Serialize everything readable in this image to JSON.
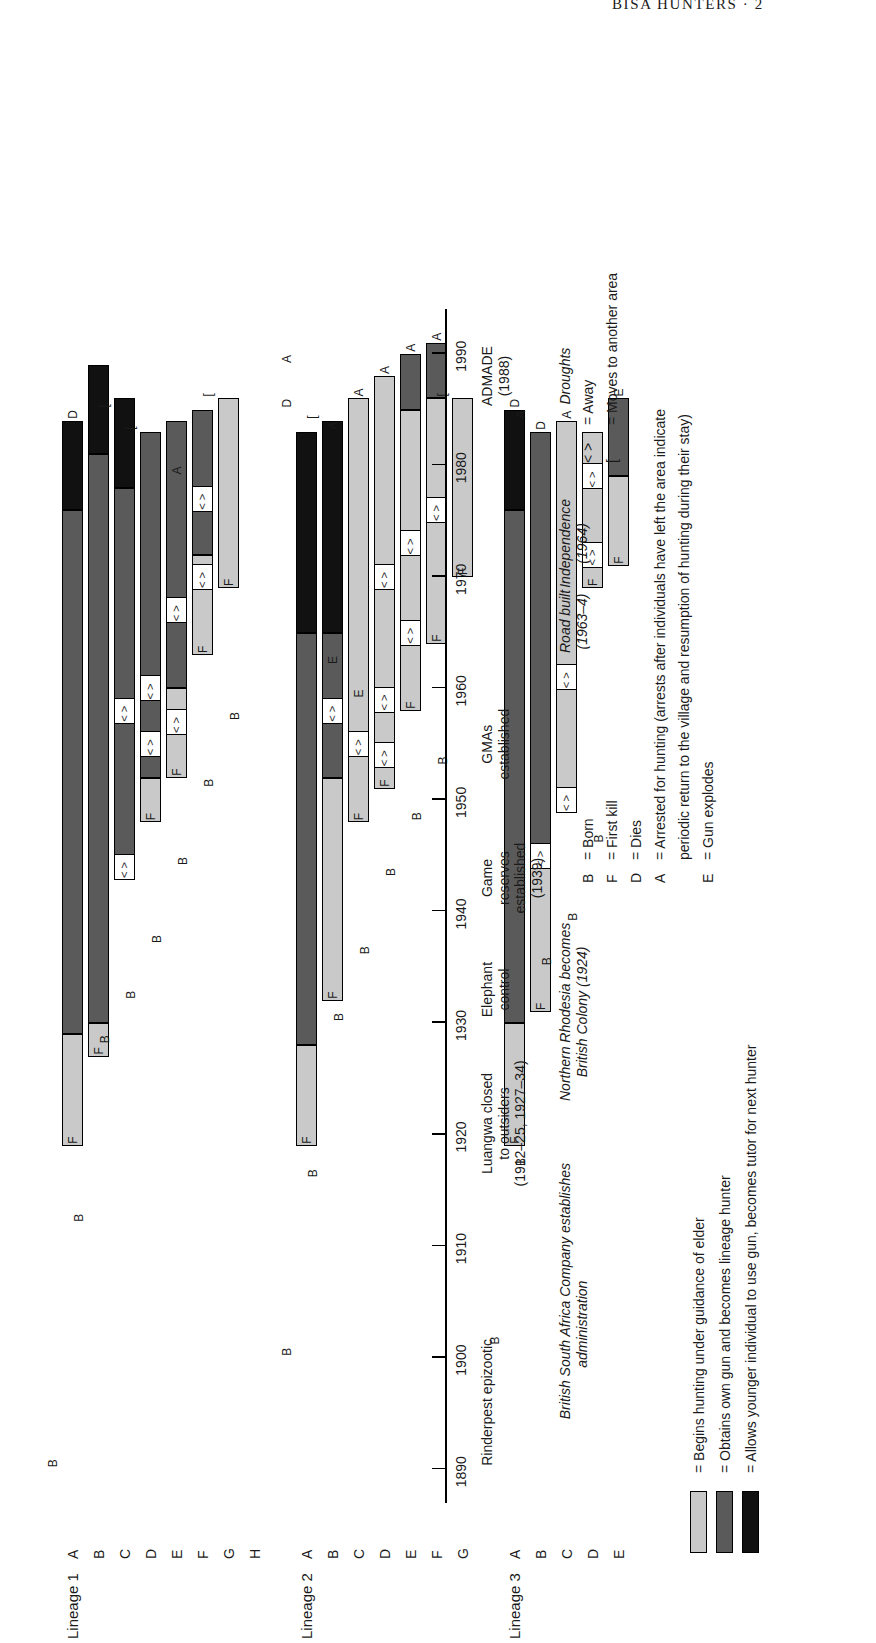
{
  "running_head": "BISA HUNTERS · 2",
  "figure": {
    "axis": {
      "ticks": [
        1890,
        1900,
        1910,
        1920,
        1930,
        1940,
        1950,
        1960,
        1970,
        1980,
        1990
      ],
      "min": 1885,
      "max": 1995
    },
    "events_upper": [
      {
        "lines": [
          "Rinderpest epizootic"
        ],
        "year": 1896,
        "italic": false
      },
      {
        "lines": [
          "Luangwa closed",
          "to outsiders",
          "(1912–25, 1927–34)"
        ],
        "year": 1921,
        "italic": false
      },
      {
        "lines": [
          "Elephant",
          "control"
        ],
        "year": 1933,
        "italic": false
      },
      {
        "lines": [
          "Game",
          "reserves",
          "established",
          "(1939)"
        ],
        "year": 1943,
        "italic": false
      },
      {
        "lines": [
          "GMAs",
          "established"
        ],
        "year": 1955,
        "italic": false
      },
      {
        "lines": [
          "ADMADE",
          "(1988)"
        ],
        "year": 1988,
        "italic": false
      }
    ],
    "events_lower": [
      {
        "lines": [
          "British South Africa Company establishes",
          "administration"
        ],
        "year": 1903,
        "italic": true
      },
      {
        "lines": [
          "Northern Rhodesia becomes",
          "British Colony (1924)"
        ],
        "year": 1931,
        "italic": true
      },
      {
        "lines": [
          "Road built",
          "(1963–4)"
        ],
        "year": 1966,
        "italic": true
      },
      {
        "lines": [
          "Independence",
          "(1964)"
        ],
        "year": 1973,
        "italic": true
      },
      {
        "lines": [
          "Droughts"
        ],
        "year": 1988,
        "italic": true
      }
    ],
    "lineages": [
      {
        "title": "Lineage 1",
        "hunters": [
          "A",
          "B",
          "C",
          "D",
          "E",
          "F",
          "G",
          "H"
        ]
      },
      {
        "title": "Lineage 2",
        "hunters": [
          "A",
          "B",
          "C",
          "D",
          "E",
          "F",
          "G"
        ]
      },
      {
        "title": "Lineage 3",
        "hunters": [
          "A",
          "B",
          "C",
          "D",
          "E"
        ]
      }
    ],
    "key_swatches": [
      {
        "fill": "#c9c9c9",
        "text": "= Begins hunting under guidance of elder"
      },
      {
        "fill": "#5a5a5a",
        "text": "= Obtains own gun and becomes lineage hunter"
      },
      {
        "fill": "#111111",
        "text": "= Allows younger individual to use gun, becomes tutor for next hunter"
      }
    ],
    "key_letters": [
      {
        "sym": "B",
        "text": "=  Born"
      },
      {
        "sym": "F",
        "text": "=  First kill"
      },
      {
        "sym": "D",
        "text": "=  Dies"
      },
      {
        "sym": "A",
        "text": "=  Arrested for hunting (arrests after individuals have left the area indicate"
      },
      {
        "sym": "",
        "text": "periodic return to the village and resumption of hunting during their stay)"
      },
      {
        "sym": "E",
        "text": "=  Gun explodes"
      }
    ],
    "key_symbols": [
      {
        "sym": "< >",
        "text": "=  Away"
      },
      {
        "sym": "[",
        "text": "=  Moves to another area"
      }
    ]
  },
  "chart_data": {
    "type": "bar",
    "xlabel": "Year",
    "ylabel": "",
    "xlim": [
      1885,
      1995
    ],
    "grid": false,
    "legend": "key at lower right",
    "phase_colors": {
      "apprentice": "#c9c9c9",
      "lineage_hunter": "#5a5a5a",
      "tutor": "#111111",
      "away": "#ffffff"
    },
    "series": [
      {
        "lineage": "Lineage 1",
        "hunters": [
          {
            "id": "A",
            "born": 1890,
            "first_kill": 1919,
            "segments": [
              {
                "phase": "apprentice",
                "start": 1919,
                "end": 1929
              },
              {
                "phase": "lineage_hunter",
                "start": 1929,
                "end": 1976
              },
              {
                "phase": "tutor",
                "start": 1976,
                "end": 1984
              }
            ],
            "events": [
              {
                "code": "B",
                "year": 1890
              },
              {
                "code": "F",
                "year": 1919
              },
              {
                "code": "D",
                "year": 1984
              }
            ]
          },
          {
            "id": "B",
            "born": 1912,
            "first_kill": 1927,
            "segments": [
              {
                "phase": "apprentice",
                "start": 1927,
                "end": 1930
              },
              {
                "phase": "lineage_hunter",
                "start": 1930,
                "end": 1981
              },
              {
                "phase": "tutor",
                "start": 1981,
                "end": 1989
              }
            ],
            "events": [
              {
                "code": "B",
                "year": 1912
              },
              {
                "code": "F",
                "year": 1927
              }
            ]
          },
          {
            "id": "C",
            "born": 1928,
            "first_kill": 1943,
            "segments": [
              {
                "phase": "lineage_hunter",
                "start": 1943,
                "end": 1978
              },
              {
                "phase": "tutor",
                "start": 1978,
                "end": 1986
              }
            ],
            "events": [
              {
                "code": "B",
                "year": 1928
              },
              {
                "code": "<>",
                "year": 1944
              },
              {
                "code": "<>",
                "year": 1958
              },
              {
                "code": "[",
                "year": 1985
              }
            ]
          },
          {
            "id": "D",
            "born": 1932,
            "first_kill": 1948,
            "segments": [
              {
                "phase": "apprentice",
                "start": 1948,
                "end": 1952
              },
              {
                "phase": "lineage_hunter",
                "start": 1952,
                "end": 1983
              }
            ],
            "events": [
              {
                "code": "B",
                "year": 1932
              },
              {
                "code": "F",
                "year": 1948
              },
              {
                "code": "<>",
                "year": 1955
              },
              {
                "code": "<>",
                "year": 1960
              },
              {
                "code": "[",
                "year": 1983
              }
            ]
          },
          {
            "id": "E",
            "born": 1937,
            "first_kill": 1952,
            "segments": [
              {
                "phase": "apprentice",
                "start": 1952,
                "end": 1960
              },
              {
                "phase": "lineage_hunter",
                "start": 1960,
                "end": 1984
              }
            ],
            "events": [
              {
                "code": "B",
                "year": 1937
              },
              {
                "code": "F",
                "year": 1952
              },
              {
                "code": "<>",
                "year": 1957
              },
              {
                "code": "<>",
                "year": 1967
              },
              {
                "code": "A",
                "year": 1979
              }
            ]
          },
          {
            "id": "F",
            "born": 1944,
            "first_kill": 1963,
            "segments": [
              {
                "phase": "apprentice",
                "start": 1963,
                "end": 1972
              },
              {
                "phase": "lineage_hunter",
                "start": 1972,
                "end": 1985
              }
            ],
            "events": [
              {
                "code": "B",
                "year": 1944
              },
              {
                "code": "F",
                "year": 1963
              },
              {
                "code": "<>",
                "year": 1970
              },
              {
                "code": "<>",
                "year": 1977
              }
            ]
          },
          {
            "id": "G",
            "born": 1951,
            "first_kill": 1969,
            "segments": [
              {
                "phase": "apprentice",
                "start": 1969,
                "end": 1986
              }
            ],
            "events": [
              {
                "code": "B",
                "year": 1951
              },
              {
                "code": "F",
                "year": 1969
              },
              {
                "code": "[",
                "year": 1986
              }
            ]
          },
          {
            "id": "H",
            "born": 1957,
            "first_kill": null,
            "segments": [],
            "events": [
              {
                "code": "B",
                "year": 1957
              }
            ]
          }
        ]
      },
      {
        "lineage": "Lineage 2",
        "hunters": [
          {
            "id": "A",
            "born": 1900,
            "first_kill": 1919,
            "segments": [
              {
                "phase": "apprentice",
                "start": 1919,
                "end": 1928
              },
              {
                "phase": "lineage_hunter",
                "start": 1928,
                "end": 1965
              },
              {
                "phase": "tutor",
                "start": 1965,
                "end": 1983
              }
            ],
            "events": [
              {
                "code": "B",
                "year": 1900
              },
              {
                "code": "F",
                "year": 1919
              },
              {
                "code": "D",
                "year": 1985
              },
              {
                "code": "A",
                "year": 1989
              }
            ]
          },
          {
            "id": "B",
            "born": 1916,
            "first_kill": 1932,
            "segments": [
              {
                "phase": "apprentice",
                "start": 1932,
                "end": 1952
              },
              {
                "phase": "lineage_hunter",
                "start": 1952,
                "end": 1965
              },
              {
                "phase": "tutor",
                "start": 1965,
                "end": 1984
              }
            ],
            "events": [
              {
                "code": "B",
                "year": 1916
              },
              {
                "code": "F",
                "year": 1932
              },
              {
                "code": "<>",
                "year": 1958
              },
              {
                "code": "E",
                "year": 1962
              },
              {
                "code": "A",
                "year": 1983
              },
              {
                "code": "[",
                "year": 1984
              }
            ]
          },
          {
            "id": "C",
            "born": 1930,
            "first_kill": 1948,
            "segments": [
              {
                "phase": "apprentice",
                "start": 1948,
                "end": 1986
              }
            ],
            "events": [
              {
                "code": "B",
                "year": 1930
              },
              {
                "code": "F",
                "year": 1948
              },
              {
                "code": "<>",
                "year": 1955
              },
              {
                "code": "E",
                "year": 1959
              },
              {
                "code": "A",
                "year": 1986
              }
            ]
          },
          {
            "id": "D",
            "born": 1936,
            "first_kill": 1951,
            "segments": [
              {
                "phase": "apprentice",
                "start": 1951,
                "end": 1988
              }
            ],
            "events": [
              {
                "code": "B",
                "year": 1936
              },
              {
                "code": "F",
                "year": 1951
              },
              {
                "code": "<>",
                "year": 1954
              },
              {
                "code": "<>",
                "year": 1959
              },
              {
                "code": "<>",
                "year": 1970
              },
              {
                "code": "A",
                "year": 1988
              }
            ]
          },
          {
            "id": "E",
            "born": 1943,
            "first_kill": 1958,
            "segments": [
              {
                "phase": "apprentice",
                "start": 1958,
                "end": 1985
              },
              {
                "phase": "lineage_hunter",
                "start": 1985,
                "end": 1990
              }
            ],
            "events": [
              {
                "code": "B",
                "year": 1943
              },
              {
                "code": "F",
                "year": 1958
              },
              {
                "code": "<>",
                "year": 1965
              },
              {
                "code": "<>",
                "year": 1973
              },
              {
                "code": "A",
                "year": 1990
              }
            ]
          },
          {
            "id": "F",
            "born": 1948,
            "first_kill": 1964,
            "segments": [
              {
                "phase": "apprentice",
                "start": 1964,
                "end": 1986
              },
              {
                "phase": "lineage_hunter",
                "start": 1986,
                "end": 1991
              }
            ],
            "events": [
              {
                "code": "B",
                "year": 1948
              },
              {
                "code": "F",
                "year": 1964
              },
              {
                "code": "<>",
                "year": 1976
              },
              {
                "code": "A",
                "year": 1991
              }
            ]
          },
          {
            "id": "G",
            "born": 1953,
            "first_kill": 1970,
            "segments": [
              {
                "phase": "apprentice",
                "start": 1970,
                "end": 1986
              }
            ],
            "events": [
              {
                "code": "B",
                "year": 1953
              },
              {
                "code": "F",
                "year": 1970
              },
              {
                "code": "[",
                "year": 1986
              }
            ]
          }
        ]
      },
      {
        "lineage": "Lineage 3",
        "hunters": [
          {
            "id": "A",
            "born": 1901,
            "first_kill": 1919,
            "segments": [
              {
                "phase": "apprentice",
                "start": 1919,
                "end": 1930
              },
              {
                "phase": "lineage_hunter",
                "start": 1930,
                "end": 1976
              },
              {
                "phase": "tutor",
                "start": 1976,
                "end": 1985
              }
            ],
            "events": [
              {
                "code": "B",
                "year": 1901
              },
              {
                "code": "F",
                "year": 1919
              },
              {
                "code": "D",
                "year": 1985
              }
            ]
          },
          {
            "id": "B",
            "born": 1917,
            "first_kill": 1931,
            "segments": [
              {
                "phase": "apprentice",
                "start": 1931,
                "end": 1946
              },
              {
                "phase": "lineage_hunter",
                "start": 1946,
                "end": 1983
              }
            ],
            "events": [
              {
                "code": "B",
                "year": 1917
              },
              {
                "code": "F",
                "year": 1931
              },
              {
                "code": "<>",
                "year": 1945
              },
              {
                "code": "D",
                "year": 1983
              },
              {
                "code": "A",
                "year": 1984
              }
            ]
          },
          {
            "id": "C",
            "born": 1935,
            "first_kill": 1951,
            "segments": [
              {
                "phase": "apprentice",
                "start": 1951,
                "end": 1984
              }
            ],
            "events": [
              {
                "code": "B",
                "year": 1935
              },
              {
                "code": "<>",
                "year": 1950
              },
              {
                "code": "<>",
                "year": 1961
              },
              {
                "code": "A",
                "year": 1984
              }
            ]
          },
          {
            "id": "D",
            "born": 1939,
            "first_kill": 1969,
            "segments": [
              {
                "phase": "apprentice",
                "start": 1969,
                "end": 1983
              }
            ],
            "events": [
              {
                "code": "B",
                "year": 1939
              },
              {
                "code": "F",
                "year": 1969
              },
              {
                "code": "<>",
                "year": 1972
              },
              {
                "code": "<>",
                "year": 1979
              }
            ]
          },
          {
            "id": "E",
            "born": 1946,
            "first_kill": 1971,
            "segments": [
              {
                "phase": "apprentice",
                "start": 1971,
                "end": 1979
              },
              {
                "phase": "lineage_hunter",
                "start": 1979,
                "end": 1986
              }
            ],
            "events": [
              {
                "code": "B",
                "year": 1946
              },
              {
                "code": "F",
                "year": 1971
              },
              {
                "code": "E",
                "year": 1986
              }
            ]
          }
        ]
      }
    ]
  }
}
